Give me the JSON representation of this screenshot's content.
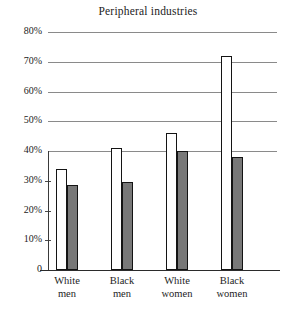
{
  "chart_data": {
    "type": "bar",
    "title": "Peripheral industries",
    "xlabel": "",
    "ylabel": "",
    "ylim": [
      0,
      80
    ],
    "grid": true,
    "legend": "none",
    "categories": [
      "White men",
      "Black men",
      "White women",
      "Black women"
    ],
    "category_lines": [
      [
        "White",
        "men"
      ],
      [
        "Black",
        "men"
      ],
      [
        "White",
        "women"
      ],
      [
        "Black",
        "women"
      ]
    ],
    "ytick_labels": [
      "80%",
      "70%",
      "60%",
      "50%",
      "40%",
      "30%",
      "20%",
      "10%",
      "0"
    ],
    "ytick_values": [
      80,
      70,
      60,
      50,
      40,
      30,
      20,
      10,
      0
    ],
    "series": [
      {
        "name": "open",
        "style": "unfilled-outline",
        "color": "#ffffff",
        "edge_color": "#141414",
        "values": [
          34,
          41,
          46,
          72
        ]
      },
      {
        "name": "shaded",
        "style": "gray-filled",
        "color": "#787878",
        "edge_color": "#141414",
        "values": [
          28.5,
          29.5,
          40,
          38
        ]
      }
    ]
  },
  "colors": {
    "gridline": "#8a8a8a",
    "axis": "#2b2b2b",
    "text": "#1d1d1d",
    "bar_fill_gray": "#787878",
    "bar_fill_open": "#ffffff",
    "bar_edge": "#141414",
    "background": "#ffffff"
  }
}
